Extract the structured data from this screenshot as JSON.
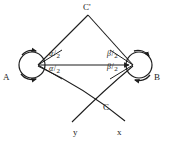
{
  "figure": {
    "background_color": "#ffffff",
    "stroke_color": "#1d1d1d",
    "vertices": [
      {
        "id": "A",
        "label": "A",
        "x": 38,
        "y": 65,
        "has_rotation_loop": true
      },
      {
        "id": "B",
        "label": "B",
        "x": 133,
        "y": 65,
        "has_rotation_loop": true
      },
      {
        "id": "Cprime",
        "label": "C'",
        "x": 88,
        "y": 15,
        "has_rotation_loop": false
      },
      {
        "id": "C",
        "label": "C",
        "x": 97,
        "y": 108,
        "has_rotation_loop": false
      }
    ],
    "angle_labels": [
      {
        "id": "alpha-upper",
        "numerator": "α",
        "slash": "/",
        "denominator": "2",
        "at_vertex": "A"
      },
      {
        "id": "alpha-lower",
        "numerator": "α",
        "slash": "/",
        "denominator": "2",
        "at_vertex": "A"
      },
      {
        "id": "beta-upper",
        "numerator": "β",
        "slash": "/",
        "denominator": "2",
        "at_vertex": "B"
      },
      {
        "id": "beta-lower",
        "numerator": "β",
        "slash": "/",
        "denominator": "2",
        "at_vertex": "B"
      }
    ],
    "axis_labels": [
      {
        "id": "y",
        "label": "y"
      },
      {
        "id": "x",
        "label": "x"
      }
    ],
    "edges": [
      {
        "id": "A-Cprime",
        "from": "A",
        "to": "Cprime",
        "style": "straight"
      },
      {
        "id": "Cprime-B",
        "from": "Cprime",
        "to": "B",
        "style": "straight"
      },
      {
        "id": "A-B",
        "from": "A",
        "to": "B",
        "style": "straight",
        "arrowhead": "end"
      },
      {
        "id": "A-lower-curve",
        "from": "A",
        "to": "x-axis",
        "style": "curved"
      },
      {
        "id": "B-lower-curve",
        "from": "B",
        "to": "y-axis",
        "style": "curved"
      }
    ]
  }
}
